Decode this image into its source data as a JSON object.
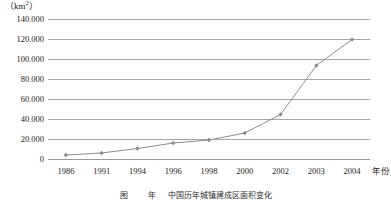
{
  "chart_data": {
    "type": "line",
    "title": "",
    "subtitle": "",
    "xlabel": "年份",
    "ylabel": "",
    "y_unit_label": "(km2)",
    "y_unit_prefix": "（km",
    "y_unit_exponent": "2",
    "y_unit_suffix": "）",
    "categories": [
      "1986",
      "1991",
      "1994",
      "1996",
      "1998",
      "2000",
      "2002",
      "2003",
      "2004"
    ],
    "values": [
      4000,
      6000,
      10500,
      16000,
      19000,
      26000,
      44500,
      93500,
      119500
    ],
    "series": [
      {
        "name": "面积",
        "values": [
          4000,
          6000,
          10500,
          16000,
          19000,
          26000,
          44500,
          93500,
          119500
        ]
      }
    ],
    "ylim": [
      0,
      140000
    ],
    "ytick_values": [
      0,
      20000,
      40000,
      60000,
      80000,
      100000,
      120000,
      140000
    ],
    "ytick_labels": [
      "0",
      "20.000",
      "40.000",
      "60.000",
      "80.000",
      "100.000",
      "120.000",
      "140.000"
    ],
    "grid": true,
    "grid_axis": "y",
    "legend": false,
    "legend_position": "none",
    "marker": "diamond",
    "line_color": "#8c8c8c",
    "marker_color": "#8c8c8c",
    "grid_color": "#a6a6a6",
    "axis_color": "#9a9a9a",
    "text_color": "#1d1d1d",
    "annotations": []
  },
  "caption": {
    "text": "图     　　 年  　 中国历年城镇建成区面积变化"
  }
}
